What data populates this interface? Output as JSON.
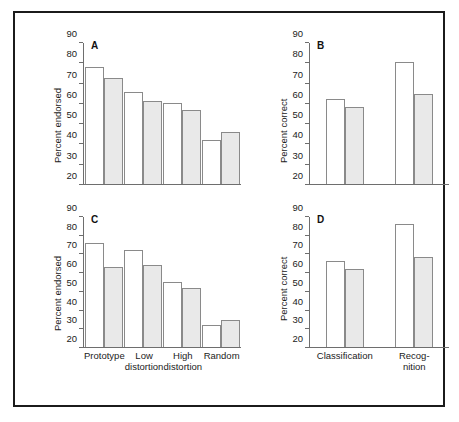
{
  "figure": {
    "ylabel_left": "Percent endorsed",
    "ylabel_right": "Percent correct",
    "axis_color": "#6e6e6e",
    "bar_fill_open": "#ffffff",
    "bar_fill_gray": "#e9e9e9",
    "bar_stroke": "#8a8a8a",
    "frame_color": "#1b1b1b"
  },
  "chart_data": [
    {
      "type": "bar",
      "panel": "A",
      "title": "A",
      "xlabel": "",
      "ylabel": "Percent endorsed",
      "ylim": [
        20,
        90
      ],
      "yticks": [
        20,
        30,
        40,
        50,
        60,
        70,
        80,
        90
      ],
      "ticklabels": [
        "20",
        "30",
        "40",
        "50",
        "60",
        "70",
        "80",
        "90"
      ],
      "grid": false,
      "legend": "none",
      "categories": [
        "Prototype",
        "Low distortion",
        "High distortion",
        "Random"
      ],
      "series": [
        {
          "name": "open",
          "values": [
            78.0,
            65.8,
            60.0,
            41.8
          ]
        },
        {
          "name": "filled",
          "values": [
            72.8,
            61.0,
            56.6,
            46.0
          ]
        }
      ]
    },
    {
      "type": "bar",
      "panel": "B",
      "title": "B",
      "xlabel": "",
      "ylabel": "Percent correct",
      "ylim": [
        20,
        90
      ],
      "yticks": [
        20,
        30,
        40,
        50,
        60,
        70,
        80,
        90
      ],
      "ticklabels": [
        "20",
        "30",
        "40",
        "50",
        "60",
        "70",
        "80",
        "90"
      ],
      "grid": false,
      "legend": "none",
      "categories": [
        "Classification",
        "Recog- nition"
      ],
      "series": [
        {
          "name": "open",
          "values": [
            62.0,
            80.8
          ]
        },
        {
          "name": "filled",
          "values": [
            58.0,
            64.6
          ]
        }
      ]
    },
    {
      "type": "bar",
      "panel": "C",
      "title": "C",
      "xlabel": "",
      "ylabel": "Percent endorsed",
      "ylim": [
        20,
        90
      ],
      "yticks": [
        20,
        30,
        40,
        50,
        60,
        70,
        80,
        90
      ],
      "ticklabels": [
        "20",
        "30",
        "40",
        "50",
        "60",
        "70",
        "80",
        "90"
      ],
      "grid": false,
      "legend": "none",
      "categories": [
        "Prototype",
        "Low distortion",
        "High distortion",
        "Random"
      ],
      "series": [
        {
          "name": "open",
          "values": [
            76.2,
            72.2,
            55.0,
            32.0
          ]
        },
        {
          "name": "filled",
          "values": [
            63.0,
            64.2,
            52.0,
            34.5
          ]
        }
      ]
    },
    {
      "type": "bar",
      "panel": "D",
      "title": "D",
      "xlabel": "",
      "ylabel": "Percent correct",
      "ylim": [
        20,
        90
      ],
      "yticks": [
        20,
        30,
        40,
        50,
        60,
        70,
        80,
        90
      ],
      "ticklabels": [
        "20",
        "30",
        "40",
        "50",
        "60",
        "70",
        "80",
        "90"
      ],
      "grid": false,
      "legend": "none",
      "categories": [
        "Classification",
        "Recog- nition"
      ],
      "series": [
        {
          "name": "open",
          "values": [
            66.5,
            86.0
          ]
        },
        {
          "name": "filled",
          "values": [
            62.2,
            68.5
          ]
        }
      ]
    }
  ],
  "labels": {
    "panel_a": "A",
    "panel_b": "B",
    "panel_c": "C",
    "panel_d": "D",
    "cat_prototype": "Prototype",
    "cat_low_1": "Low",
    "cat_low_2": "distortion",
    "cat_high_1": "High",
    "cat_high_2": "distortion",
    "cat_random": "Random",
    "cat_classification": "Classification",
    "cat_recognition_1": "Recog-",
    "cat_recognition_2": "nition"
  }
}
